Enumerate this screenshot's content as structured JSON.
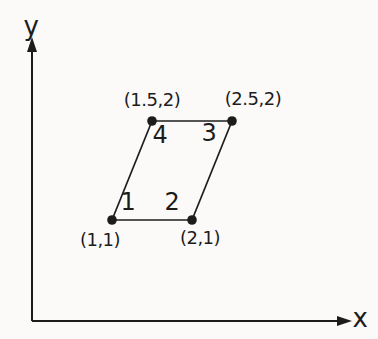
{
  "colors": {
    "background": "#fbfaf8",
    "ink": "#1c1c1c"
  },
  "axes": {
    "x_label": "x",
    "y_label": "y"
  },
  "element": {
    "description": "quadrilateral element with numbered nodes",
    "nodes": [
      {
        "number": "1",
        "coord_label": "(1,1)",
        "x": 1,
        "y": 1
      },
      {
        "number": "2",
        "coord_label": "(2,1)",
        "x": 2,
        "y": 1
      },
      {
        "number": "3",
        "coord_label": "(2.5,2)",
        "x": 2.5,
        "y": 2
      },
      {
        "number": "4",
        "coord_label": "(1.5,2)",
        "x": 1.5,
        "y": 2
      }
    ],
    "edges": [
      [
        0,
        1
      ],
      [
        1,
        2
      ],
      [
        2,
        3
      ],
      [
        3,
        0
      ]
    ]
  }
}
